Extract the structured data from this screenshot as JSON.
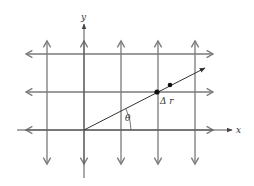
{
  "diagram": {
    "axes": {
      "x_label": "x",
      "y_label": "y"
    },
    "labels": {
      "delta_r": "Δ r",
      "theta": "θ"
    },
    "colors": {
      "grid": "#7a7a7a",
      "axis": "#555555",
      "ray": "#333333",
      "dot": "#111111",
      "background": "#ffffff"
    },
    "grid": {
      "vertical_x": [
        47,
        84,
        121,
        158,
        195
      ],
      "horizontal_y": [
        54,
        92,
        130
      ]
    },
    "ray": {
      "from": [
        84,
        130
      ],
      "to": [
        205,
        68
      ]
    },
    "points": [
      [
        157,
        92
      ],
      [
        170,
        85
      ]
    ]
  }
}
